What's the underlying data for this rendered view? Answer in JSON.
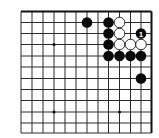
{
  "board": {
    "description": "Top-right corner of a Go board diagram",
    "visible_columns": 13,
    "visible_rows": 12,
    "edges": [
      "top",
      "right"
    ],
    "grid": {
      "x": [
        21,
        32,
        43,
        54,
        65,
        76,
        87,
        98,
        108.5,
        119.5,
        130.5,
        141,
        151.5
      ],
      "y": [
        11.5,
        22.5,
        33.5,
        44.5,
        56,
        67,
        78.5,
        89.5,
        100.5,
        112,
        123,
        133
      ]
    },
    "star_points": [
      {
        "col": 3,
        "row": 3
      },
      {
        "col": 3,
        "row": 9
      },
      {
        "col": 9,
        "row": 9
      }
    ],
    "stones": [
      {
        "color": "black",
        "col": 6,
        "row": 1
      },
      {
        "color": "black",
        "col": 8,
        "row": 1
      },
      {
        "color": "white",
        "col": 9,
        "row": 1
      },
      {
        "color": "black",
        "col": 8,
        "row": 2
      },
      {
        "color": "white",
        "col": 9,
        "row": 2
      },
      {
        "color": "black",
        "col": 11,
        "row": 2,
        "label": "1"
      },
      {
        "color": "black",
        "col": 8,
        "row": 3
      },
      {
        "color": "white",
        "col": 9,
        "row": 3
      },
      {
        "color": "white",
        "col": 10,
        "row": 3
      },
      {
        "color": "white",
        "col": 11,
        "row": 3
      },
      {
        "color": "black",
        "col": 8,
        "row": 4
      },
      {
        "color": "black",
        "col": 9,
        "row": 4
      },
      {
        "color": "black",
        "col": 10,
        "row": 4
      },
      {
        "color": "black",
        "col": 11,
        "row": 4
      },
      {
        "color": "black",
        "col": 11,
        "row": 6
      }
    ],
    "move_label": "1",
    "colors": {
      "black": "#0a0a0a",
      "white": "#ffffff",
      "lines": "#2a2a2a",
      "background": "#ffffff"
    }
  }
}
